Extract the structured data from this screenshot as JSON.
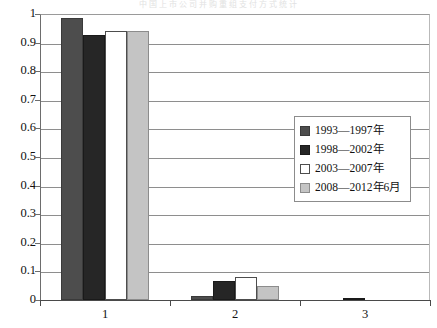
{
  "bleed_text": "中国上市公司并购重组支付方式统计",
  "chart_data": {
    "type": "bar",
    "title": "",
    "xlabel": "",
    "ylabel": "",
    "categories": [
      "1",
      "2",
      "3"
    ],
    "ylim": [
      0,
      1
    ],
    "yticks": [
      "1",
      "0.9",
      "0.8",
      "0.7",
      "0.6",
      "0.5",
      "0.4",
      "0.3",
      "0.2",
      "0.1",
      "0"
    ],
    "ytick_values": [
      1,
      0.9,
      0.8,
      0.7,
      0.6,
      0.5,
      0.4,
      0.3,
      0.2,
      0.1,
      0
    ],
    "grid": true,
    "legend_position": "center-right",
    "series": [
      {
        "name": "1993—1997年",
        "color": "#4d4d4d",
        "border": "#3a3a3a",
        "values": [
          0.985,
          0.015,
          0.0
        ]
      },
      {
        "name": "1998—2002年",
        "color": "#262626",
        "border": "#1a1a1a",
        "values": [
          0.925,
          0.065,
          0.006
        ]
      },
      {
        "name": "2003—2007年",
        "color": "#ffffff",
        "border": "#4d4d4d",
        "values": [
          0.94,
          0.08,
          0.0
        ]
      },
      {
        "name": "2008—2012年6月",
        "color": "#c4c4c4",
        "border": "#8c8c8c",
        "values": [
          0.94,
          0.05,
          0.0
        ]
      }
    ]
  }
}
